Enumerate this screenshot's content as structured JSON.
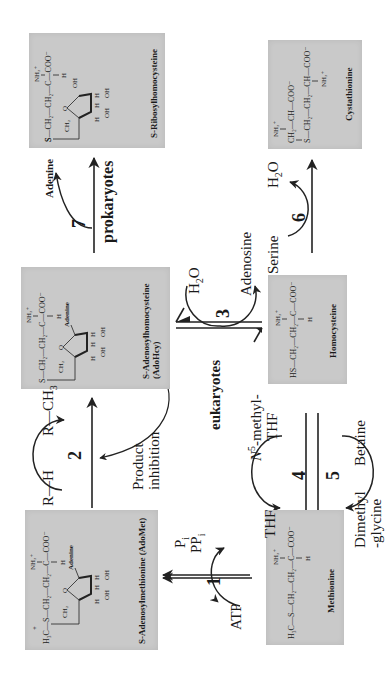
{
  "figure": {
    "orientation": "rotated 90 degrees counter-clockwise",
    "background": "#ffffff",
    "box_color": "#c9c9c9"
  },
  "molecules": {
    "adomet": {
      "name": "S-Adenosylmethionine (AdoMet)",
      "formula_lines": [
        "H3C—S+—CH2—CH2—C—COO⁻",
        "NH3+",
        "H",
        "CH2",
        "Adenine",
        "O",
        "H H H H",
        "OH OH"
      ]
    },
    "adohcy": {
      "name_line1": "S-Adenosylhomocysteine",
      "name_line2": "(AdoHcy)",
      "formula_lines": [
        "S—CH2—CH2—C—COO⁻",
        "NH3+",
        "H",
        "CH2",
        "Adenine",
        "O",
        "H H H H",
        "OH OH"
      ]
    },
    "ribosylhomocysteine": {
      "name": "S-Ribosylhomocysteine",
      "formula_lines": [
        "S—CH2—CH2—C—COO⁻",
        "NH3+",
        "H",
        "CH2",
        "O",
        "OH",
        "H H H H",
        "OH OH"
      ]
    },
    "methionine": {
      "name": "Methionine",
      "formula_lines": [
        "H3C—S—CH2—CH2—C—COO⁻",
        "NH3+",
        "H"
      ]
    },
    "homocysteine": {
      "name": "Homocysteine",
      "formula_lines": [
        "HS—CH2—CH2—C—COO⁻",
        "NH3+",
        "H"
      ]
    },
    "cystathionine": {
      "name": "Cystathionine",
      "formula_lines": [
        "CH2—CH—COO⁻",
        "NH3+",
        "S—CH2—CH2—CH—COO⁻",
        "NH3+"
      ]
    }
  },
  "reactions": [
    {
      "step": "1",
      "inputs": [
        "ATP"
      ],
      "outputs": [
        "Pi",
        "PPi"
      ]
    },
    {
      "step": "2",
      "inputs": [
        "R—H"
      ],
      "outputs": [
        "R—CH3"
      ],
      "note": "Product inhibition"
    },
    {
      "step": "3",
      "inputs": [
        "H2O"
      ],
      "outputs": [
        "Adenosine"
      ],
      "organism": "eukaryotes"
    },
    {
      "step": "4",
      "inputs": [
        "N5-methyl-THF"
      ],
      "outputs": [
        "THF"
      ]
    },
    {
      "step": "5",
      "inputs": [
        "Betaine"
      ],
      "outputs": [
        "Dimethyl-glycine"
      ]
    },
    {
      "step": "6",
      "inputs": [
        "Serine"
      ],
      "outputs": [
        "H2O"
      ]
    },
    {
      "step": "7",
      "inputs": [],
      "outputs": [
        "Adenine"
      ],
      "organism": "prokaryotes"
    }
  ],
  "labels": {
    "atp": "ATP",
    "pi": "P",
    "pi_sub": "i",
    "ppi": "PP",
    "ppi_sub": "i",
    "step1": "1",
    "rh": "R—H",
    "rch3": "R—CH",
    "rch3_sub": "3",
    "step2": "2",
    "product_line1": "Product",
    "product_line2": "inhibition",
    "h2o_3": "H",
    "h2o_3_sub": "2",
    "h2o_3_o": "O",
    "step3": "3",
    "adenosine": "Adenosine",
    "eukaryotes": "eukaryotes",
    "n5_methyl": "-methyl-",
    "n5_n": "N",
    "n5_sup": "5",
    "thf_in": "THF",
    "thf_out": "THF",
    "step4": "4",
    "betaine": "Betaine",
    "dimethyl_line1": "Dimethyl",
    "dimethyl_line2": "-glycine",
    "step5": "5",
    "serine": "Serine",
    "h2o_6": "H",
    "h2o_6_sub": "2",
    "h2o_6_o": "O",
    "step6": "6",
    "adenine": "Adenine",
    "step7": "7",
    "prokaryotes": "prokaryotes"
  },
  "chem": {
    "h3c": "H₃C",
    "s": "S",
    "s_plus": "+",
    "ch2": "CH₂",
    "c": "C",
    "ch": "CH",
    "coo": "COO⁻",
    "nh3": "NH₃⁺",
    "h": "H",
    "hs": "HS",
    "o": "O",
    "oh": "OH",
    "adenine": "Adenine",
    "dash": "—"
  }
}
